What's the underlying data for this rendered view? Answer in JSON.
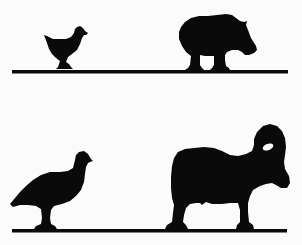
{
  "image": {
    "description": "Black silhouette metallic targets on two rails: chicken and pig on top row, turkey and ram on bottom row",
    "background_color": "#fbfbfb",
    "silhouette_color": "#0a0a0a"
  },
  "rows": [
    {
      "name": "top-rail",
      "targets": [
        {
          "animal": "chicken"
        },
        {
          "animal": "pig"
        }
      ]
    },
    {
      "name": "bottom-rail",
      "targets": [
        {
          "animal": "turkey"
        },
        {
          "animal": "ram"
        }
      ]
    }
  ]
}
